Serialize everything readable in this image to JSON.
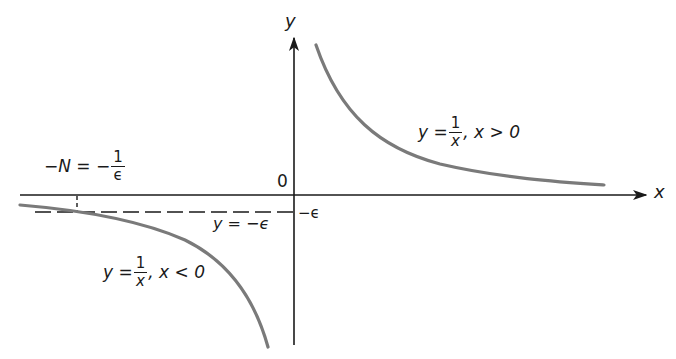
{
  "diagram": {
    "axes": {
      "x_label": "x",
      "y_label": "y",
      "origin_label": "0"
    },
    "curves": [
      {
        "name": "right-branch",
        "label_lhs": "y =",
        "label_num": "1",
        "label_den": "x",
        "label_cond": ", x > 0"
      },
      {
        "name": "left-branch",
        "label_lhs": "y =",
        "label_num": "1",
        "label_den": "x",
        "label_cond": ", x < 0"
      }
    ],
    "annotations": {
      "neg_epsilon_tick": "−ϵ",
      "dashed_line_label": "y = −ϵ",
      "N_label_lhs": "−N = −",
      "N_label_num": "1",
      "N_label_den": "ϵ"
    },
    "colors": {
      "axis": "#1a1a1a",
      "curve": "#7a7a7a",
      "dashed": "#1a1a1a"
    }
  }
}
